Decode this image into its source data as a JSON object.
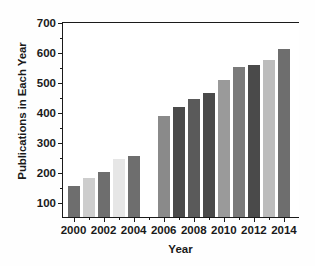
{
  "chart_data": {
    "type": "bar",
    "title": "",
    "xlabel": "Year",
    "ylabel": "Publications in Each Year",
    "categories": [
      2000,
      2001,
      2002,
      2003,
      2004,
      2006,
      2007,
      2008,
      2009,
      2010,
      2011,
      2012,
      2013,
      2014
    ],
    "values": [
      157,
      184,
      205,
      248,
      258,
      392,
      421,
      449,
      467,
      509,
      554,
      562,
      577,
      613
    ],
    "bar_colors": [
      "#6e6e6e",
      "#cdcdcd",
      "#6e6e6e",
      "#e6e6e6",
      "#6e6e6e",
      "#8a8a8a",
      "#4a4a4a",
      "#5a5a5a",
      "#4a4a4a",
      "#9a9a9a",
      "#7a7a7a",
      "#4a4a4a",
      "#bcbcbc",
      "#6e6e6e"
    ],
    "xlim": [
      1999.3,
      2015.0
    ],
    "ylim": [
      55,
      700
    ],
    "xticks": [
      2000,
      2002,
      2004,
      2006,
      2008,
      2010,
      2012,
      2014
    ],
    "xticklabels": [
      "2000",
      "2002",
      "2004",
      "2006",
      "2008",
      "2010",
      "2012",
      "2014"
    ],
    "xminorticks": [
      2001,
      2003,
      2005,
      2007,
      2009,
      2011,
      2013
    ],
    "yticks": [
      100,
      200,
      300,
      400,
      500,
      600,
      700
    ],
    "yticklabels": [
      "100",
      "200",
      "300",
      "400",
      "500",
      "600",
      "700"
    ],
    "yminorticks": [
      150,
      250,
      350,
      450,
      550,
      650
    ],
    "grid": false,
    "legend": null,
    "missing_categories": [
      2005
    ],
    "note": "Gap at 2005 - no bar plotted"
  }
}
